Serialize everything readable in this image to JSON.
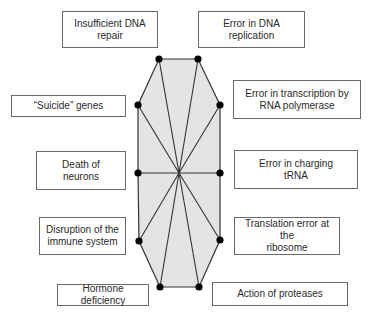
{
  "diagram": {
    "center": {
      "x": 179,
      "y": 173
    },
    "fill_color": "#e4e4e4",
    "line_color": "#333333",
    "node_color": "#000000",
    "vertices": [
      {
        "x": 159,
        "y": 59
      },
      {
        "x": 198,
        "y": 59
      },
      {
        "x": 220,
        "y": 105
      },
      {
        "x": 220,
        "y": 173
      },
      {
        "x": 220,
        "y": 240
      },
      {
        "x": 199,
        "y": 287
      },
      {
        "x": 160,
        "y": 287
      },
      {
        "x": 139,
        "y": 241
      },
      {
        "x": 138,
        "y": 173
      },
      {
        "x": 138,
        "y": 105
      }
    ],
    "labels": [
      {
        "id": "insufficient-dna-repair",
        "text": "Insufficient DNA\nrepair",
        "x": 62,
        "y": 11,
        "w": 96,
        "h": 37
      },
      {
        "id": "error-dna-replication",
        "text": "Error in DNA\nreplication",
        "x": 198,
        "y": 11,
        "w": 107,
        "h": 37
      },
      {
        "id": "error-transcription",
        "text": "Error in transcription by\nRNA polymerase",
        "x": 233,
        "y": 80,
        "w": 128,
        "h": 39
      },
      {
        "id": "suicide-genes",
        "text": "“Suicide” genes",
        "x": 11,
        "y": 95,
        "w": 115,
        "h": 22
      },
      {
        "id": "death-of-neurons",
        "text": "Death of\nneurons",
        "x": 36,
        "y": 151,
        "w": 90,
        "h": 39
      },
      {
        "id": "error-charging-trna",
        "text": "Error in charging\ntRNA",
        "x": 234,
        "y": 150,
        "w": 124,
        "h": 39
      },
      {
        "id": "disruption-immune-system",
        "text": "Disruption of the\nimmune system",
        "x": 39,
        "y": 217,
        "w": 87,
        "h": 38
      },
      {
        "id": "translation-error-ribosome",
        "text": "Translation error at the\nribosome",
        "x": 234,
        "y": 217,
        "w": 106,
        "h": 38
      },
      {
        "id": "hormone-deficiency",
        "text": "Hormone deficiency",
        "x": 57,
        "y": 284,
        "w": 92,
        "h": 22
      },
      {
        "id": "action-of-proteases",
        "text": "Action of proteases",
        "x": 212,
        "y": 282,
        "w": 136,
        "h": 24
      }
    ]
  }
}
